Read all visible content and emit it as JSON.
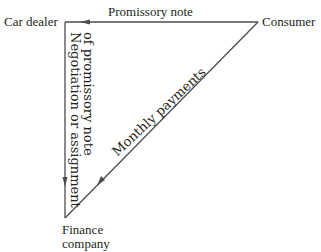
{
  "diagram": {
    "nodes": {
      "car_dealer": "Car dealer",
      "consumer": "Consumer",
      "finance_company_line1": "Finance",
      "finance_company_line2": "company"
    },
    "edges": {
      "promissory_note": "Promissory note",
      "negotiation_line1": "Negotiation or assignment",
      "negotiation_line2": "of promissory note",
      "monthly_payments": "Monthly payments"
    },
    "colors": {
      "line": "#4d4d4f",
      "text": "#231f20"
    }
  }
}
